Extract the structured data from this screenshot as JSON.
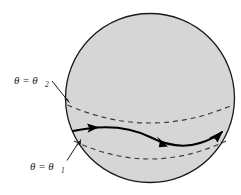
{
  "figure": {
    "background_color": "#ffffff"
  },
  "sphere": {
    "name": "sphere-outline",
    "center_x": 150,
    "center_y": 98,
    "radius": 85,
    "fill_color": "#d6d6d6",
    "stroke_color": "#1a1a1a",
    "stroke_width": 1.3
  },
  "latitudes": [
    {
      "id": "theta-2",
      "name": "latitude-circle-upper",
      "label": "θ = θ",
      "label_symbol": "θ",
      "label_equals": "=",
      "subscript": "2",
      "label_full": "θ = θ₂",
      "style": "dashed",
      "stroke_color": "#3c3c3c",
      "dash_pattern": "5,4",
      "left_x": 67,
      "right_x": 233,
      "edge_y": 104,
      "sag_y": 123
    },
    {
      "id": "theta-1",
      "name": "latitude-circle-lower",
      "label": "θ = θ",
      "label_symbol": "θ",
      "label_equals": "=",
      "subscript": "1",
      "label_full": "θ = θ₁",
      "style": "dashed",
      "stroke_color": "#3c3c3c",
      "dash_pattern": "5,4",
      "left_x": 74,
      "right_x": 226,
      "edge_y": 141,
      "sag_y": 160
    }
  ],
  "annotations": [
    {
      "name": "theta-2-annotation",
      "text": "θ = θ₂",
      "base": "θ = θ",
      "sub": "2",
      "text_x": 14,
      "text_y": 84,
      "leader_from_x": 51,
      "leader_from_y": 80,
      "leader_to_x": 69,
      "leader_to_y": 102,
      "arrow": true
    },
    {
      "name": "theta-1-annotation",
      "text": "θ = θ₁",
      "base": "θ = θ",
      "sub": "1",
      "text_x": 30,
      "text_y": 170,
      "leader_from_x": 68,
      "leader_from_y": 160,
      "leader_to_x": 80,
      "leader_to_y": 140,
      "arrow": true
    }
  ],
  "path": {
    "name": "geodesic-path",
    "stroke_color": "#000000",
    "stroke_width": 2.0,
    "start_x": 73,
    "start_y": 131,
    "end_x": 222,
    "end_y": 133,
    "arrowheads": [
      {
        "name": "path-arrowhead-start",
        "x": 96,
        "y": 128,
        "angle_deg": -8
      },
      {
        "name": "path-arrowhead-middle",
        "x": 164,
        "y": 143,
        "angle_deg": 40
      },
      {
        "name": "path-arrowhead-end",
        "x": 219,
        "y": 136,
        "angle_deg": -48
      }
    ]
  }
}
